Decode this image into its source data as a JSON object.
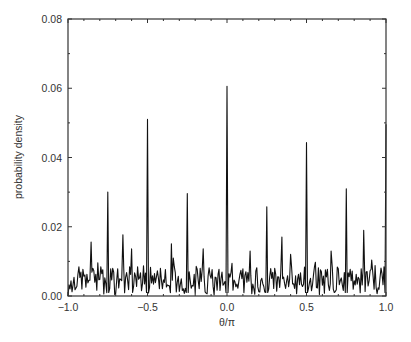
{
  "chart_data": {
    "type": "line",
    "title": "",
    "xlabel": "θ/π",
    "ylabel": "probability density",
    "xlim": [
      -1.0,
      1.0
    ],
    "ylim": [
      0.0,
      0.08
    ],
    "xticks": [
      "-1.0",
      "-0.5",
      "0.0",
      "0.5",
      "1.0"
    ],
    "yticks": [
      "0.00",
      "0.02",
      "0.04",
      "0.06",
      "0.08"
    ],
    "grid": false,
    "legend": null,
    "peaks": [
      {
        "x": -1.0,
        "y": 0.0
      },
      {
        "x": -0.855,
        "y": 0.0156
      },
      {
        "x": -0.75,
        "y": 0.03
      },
      {
        "x": -0.655,
        "y": 0.0177
      },
      {
        "x": -0.6,
        "y": 0.0136
      },
      {
        "x": -0.5,
        "y": 0.051
      },
      {
        "x": -0.35,
        "y": 0.0151
      },
      {
        "x": -0.25,
        "y": 0.0296
      },
      {
        "x": -0.15,
        "y": 0.0136
      },
      {
        "x": 0.0,
        "y": 0.0606
      },
      {
        "x": 0.145,
        "y": 0.013
      },
      {
        "x": 0.25,
        "y": 0.0258
      },
      {
        "x": 0.345,
        "y": 0.017
      },
      {
        "x": 0.4,
        "y": 0.012
      },
      {
        "x": 0.5,
        "y": 0.0443
      },
      {
        "x": 0.655,
        "y": 0.013
      },
      {
        "x": 0.75,
        "y": 0.031
      },
      {
        "x": 0.86,
        "y": 0.019
      },
      {
        "x": 0.91,
        "y": 0.0104
      },
      {
        "x": 1.0,
        "y": 0.0496
      }
    ],
    "background_level": 0.005
  }
}
